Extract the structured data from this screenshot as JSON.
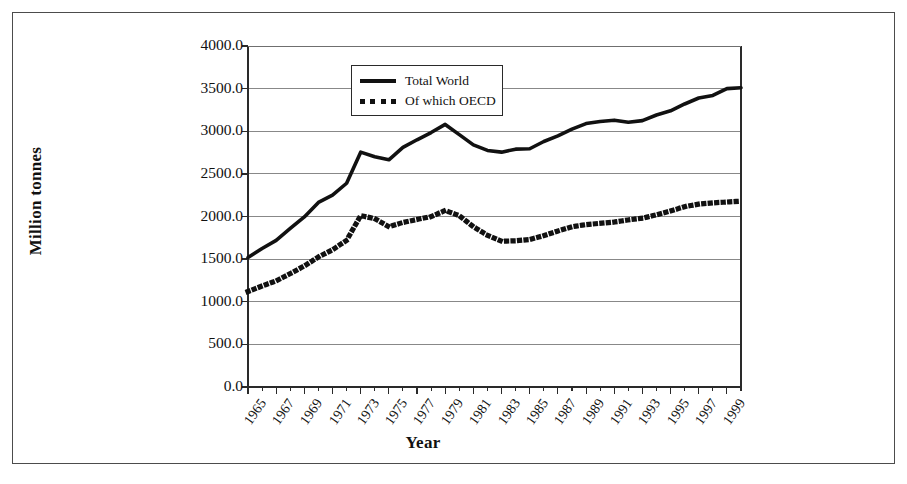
{
  "figure": {
    "border_color": "#4c4c4c",
    "background": "#ffffff"
  },
  "chart_data": {
    "type": "line",
    "title": "",
    "xlabel": "Year",
    "ylabel": "Million tonnes",
    "ylim": [
      0,
      4000
    ],
    "xlim": [
      1965,
      2000
    ],
    "grid": "horizontal",
    "legend_position": "top-center-inside",
    "ytick_labels": [
      "0.0",
      "500.0",
      "1000.0",
      "1500.0",
      "2000.0",
      "2500.0",
      "3000.0",
      "3500.0",
      "4000.0"
    ],
    "ytick_values": [
      0,
      500,
      1000,
      1500,
      2000,
      2500,
      3000,
      3500,
      4000
    ],
    "xtick_labels": [
      "1965",
      "1967",
      "1969",
      "1971",
      "1973",
      "1975",
      "1977",
      "1979",
      "1981",
      "1983",
      "1985",
      "1987",
      "1989",
      "1991",
      "1993",
      "1995",
      "1997",
      "1999"
    ],
    "xtick_values": [
      1965,
      1967,
      1969,
      1971,
      1973,
      1975,
      1977,
      1979,
      1981,
      1983,
      1985,
      1987,
      1989,
      1991,
      1993,
      1995,
      1997,
      1999
    ],
    "x": [
      1965,
      1966,
      1967,
      1968,
      1969,
      1970,
      1971,
      1972,
      1973,
      1974,
      1975,
      1976,
      1977,
      1978,
      1979,
      1980,
      1981,
      1982,
      1983,
      1984,
      1985,
      1986,
      1987,
      1988,
      1989,
      1990,
      1991,
      1992,
      1993,
      1994,
      1995,
      1996,
      1997,
      1998,
      1999,
      2000
    ],
    "series": [
      {
        "name": "Total World",
        "style": "solid",
        "color": "#111111",
        "values": [
          1520,
          1625,
          1720,
          1860,
          1995,
          2165,
          2250,
          2390,
          2755,
          2700,
          2665,
          2810,
          2900,
          2985,
          3080,
          2960,
          2840,
          2775,
          2755,
          2790,
          2795,
          2880,
          2945,
          3025,
          3090,
          3115,
          3130,
          3105,
          3125,
          3190,
          3240,
          3320,
          3390,
          3420,
          3500,
          3510
        ]
      },
      {
        "name": "Of which OECD",
        "style": "dotted",
        "color": "#111111",
        "values": [
          1120,
          1185,
          1245,
          1330,
          1420,
          1525,
          1610,
          1720,
          2010,
          1975,
          1880,
          1930,
          1965,
          2000,
          2070,
          2010,
          1880,
          1780,
          1710,
          1715,
          1730,
          1775,
          1830,
          1880,
          1905,
          1920,
          1935,
          1960,
          1980,
          2020,
          2065,
          2115,
          2145,
          2160,
          2170,
          2180
        ]
      }
    ]
  },
  "legend": {
    "entries": [
      {
        "label": "Total World",
        "swatch": "solid-line-swatch"
      },
      {
        "label": "Of which OECD",
        "swatch": "dotted-line-swatch"
      }
    ]
  }
}
